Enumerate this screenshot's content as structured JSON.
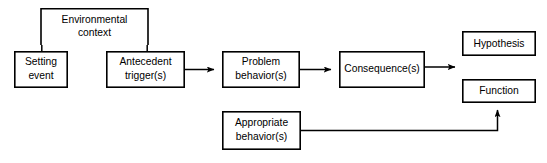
{
  "diagram": {
    "background_color": "#ffffff",
    "line_color": "#000000",
    "text_color": "#000000",
    "nodes": [
      {
        "id": "environmental-context",
        "label_line1": "Environmental",
        "label_line2": "context",
        "x": 41,
        "y": 8,
        "w": 107,
        "h": 37
      },
      {
        "id": "setting-event",
        "label_line1": "Setting",
        "label_line2": "event",
        "x": 14,
        "y": 51,
        "w": 53,
        "h": 37
      },
      {
        "id": "antecedent-triggers",
        "label_line1": "Antecedent",
        "label_line2": "trigger(s)",
        "x": 106,
        "y": 51,
        "w": 78,
        "h": 37
      },
      {
        "id": "problem-behaviors",
        "label_line1": "Problem",
        "label_line2": "behavior(s)",
        "x": 222,
        "y": 51,
        "w": 77,
        "h": 37
      },
      {
        "id": "consequences",
        "label_line1": "Consequence(s)",
        "label_line2": "",
        "x": 339,
        "y": 51,
        "w": 85,
        "h": 37
      },
      {
        "id": "hypothesis",
        "label_line1": "Hypothesis",
        "label_line2": "",
        "x": 462,
        "y": 31,
        "w": 73,
        "h": 25
      },
      {
        "id": "function",
        "label_line1": "Function",
        "label_line2": "",
        "x": 462,
        "y": 79,
        "w": 73,
        "h": 24
      },
      {
        "id": "appropriate-behaviors",
        "label_line1": "Appropriate",
        "label_line2": "behavior(s)",
        "x": 222,
        "y": 111,
        "w": 78,
        "h": 39
      }
    ],
    "connectors": [
      {
        "id": "env-to-setting",
        "from": "environmental-context",
        "to": "setting-event",
        "type": "plain-line",
        "arrowhead": false
      },
      {
        "id": "env-to-antecedent",
        "from": "environmental-context",
        "to": "antecedent-triggers",
        "type": "plain-line",
        "arrowhead": false
      },
      {
        "id": "antecedent-to-problem",
        "from": "antecedent-triggers",
        "to": "problem-behaviors",
        "type": "arrow",
        "arrowhead": true
      },
      {
        "id": "problem-to-consequence",
        "from": "problem-behaviors",
        "to": "consequences",
        "type": "arrow",
        "arrowhead": true
      },
      {
        "id": "consequence-to-outcomes",
        "from": "consequences",
        "to": "hypothesis-function",
        "type": "arrow",
        "arrowhead": true
      },
      {
        "id": "appropriate-to-function",
        "from": "appropriate-behaviors",
        "to": "function",
        "type": "elbow-arrow",
        "arrowhead": true
      }
    ]
  }
}
